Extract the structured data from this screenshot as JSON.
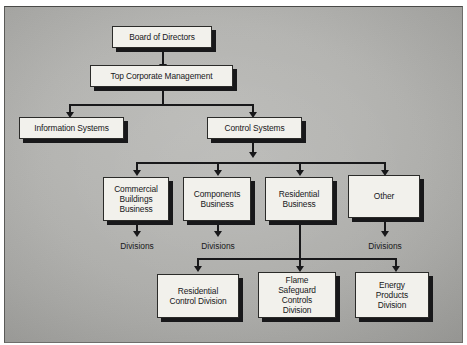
{
  "diagram": {
    "background_color": "#aeaeab",
    "box_fill_color": "#f2f1ec",
    "line_color": "#18181a",
    "nodes": [
      {
        "id": "board",
        "label": "Board of Directors",
        "level": 1
      },
      {
        "id": "top-management",
        "label": "Top Corporate Management",
        "level": 2
      },
      {
        "id": "information-systems",
        "label": "Information Systems",
        "level": 3
      },
      {
        "id": "control-systems",
        "label": "Control Systems",
        "level": 3
      },
      {
        "id": "commercial-buildings-business",
        "label": "Commercial\nBuildings\nBusiness",
        "level": 4
      },
      {
        "id": "components-business",
        "label": "Components\nBusiness",
        "level": 4
      },
      {
        "id": "residential-business",
        "label": "Residential\nBusiness",
        "level": 4
      },
      {
        "id": "other",
        "label": "Other",
        "level": 4
      },
      {
        "id": "residential-control-division",
        "label": "Residential\nControl Division",
        "level": 6
      },
      {
        "id": "flame-safeguard-controls-division",
        "label": "Flame\nSafeguard\nControls\nDivision",
        "level": 6
      },
      {
        "id": "energy-products-division",
        "label": "Energy\nProducts\nDivision",
        "level": 6
      }
    ],
    "labels": [
      {
        "id": "divisions-commercial",
        "text": "Divisions"
      },
      {
        "id": "divisions-components",
        "text": "Divisions"
      },
      {
        "id": "divisions-other",
        "text": "Divisions"
      }
    ]
  }
}
